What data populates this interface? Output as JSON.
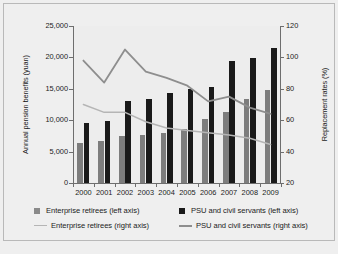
{
  "chart_data": {
    "type": "bar",
    "title": "",
    "subtitle": "",
    "xlabel": "",
    "ylabel": "Annual pension benefits (yuan)",
    "ylabel_right": "Replacement rates (%)",
    "categories": [
      "2000",
      "2001",
      "2002",
      "2003",
      "2004",
      "2005",
      "2006",
      "2007",
      "2008",
      "2009"
    ],
    "ylim": [
      0,
      25000
    ],
    "yticks": [
      0,
      5000,
      10000,
      15000,
      20000,
      25000
    ],
    "ytick_labels": [
      "0",
      "5,000",
      "10,000",
      "15,000",
      "20,000",
      "25,000"
    ],
    "ylim_right": [
      20,
      120
    ],
    "yticks_right": [
      20,
      40,
      60,
      80,
      100,
      120
    ],
    "ytick_labels_right": [
      "20",
      "40",
      "60",
      "80",
      "100",
      "120"
    ],
    "grid": false,
    "legend_position": "bottom",
    "series": [
      {
        "name": "Enterprise retirees (left axis)",
        "type": "bar",
        "axis": "left",
        "color": "#7d7d7d",
        "values": [
          6400,
          6700,
          7500,
          7600,
          8000,
          8600,
          10200,
          11300,
          13400,
          14800
        ]
      },
      {
        "name": "PSU and civil servants (left axis)",
        "type": "bar",
        "axis": "left",
        "color": "#1a1a1a",
        "values": [
          9500,
          9800,
          13100,
          13350,
          14300,
          14950,
          15300,
          19500,
          19850,
          21550
        ]
      },
      {
        "name": "Enterprise retirees (right axis)",
        "type": "line",
        "axis": "right",
        "color": "#b5b5b5",
        "values": [
          70.0,
          65.0,
          65.0,
          59.0,
          55.0,
          53.5,
          52.0,
          50.5,
          48.5,
          44.5
        ]
      },
      {
        "name": "PSU and civil servants (right axis)",
        "type": "line",
        "axis": "right",
        "color": "#8e8e8e",
        "values": [
          98.0,
          84.0,
          105.0,
          91.0,
          87.0,
          82.0,
          72.0,
          75.0,
          68.0,
          64.0
        ]
      }
    ]
  },
  "legend": {
    "entries": [
      {
        "label": "Enterprise retirees (left axis)",
        "marker": "square",
        "color": "#8a8a8a"
      },
      {
        "label": "PSU and civil servants (left axis)",
        "marker": "square",
        "color": "#1a1a1a"
      },
      {
        "label": "Enterprise retirees (right axis)",
        "marker": "line",
        "color": "#b5b5b5"
      },
      {
        "label": "PSU and civil servants (right axis)",
        "marker": "line",
        "color": "#8e8e8e"
      }
    ]
  }
}
